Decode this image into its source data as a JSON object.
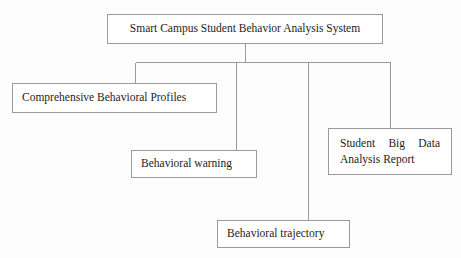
{
  "diagram": {
    "type": "hierarchy-tree",
    "orientation": "top-down",
    "line_color": "#9a9a9a",
    "box_border_color": "#9a9a9a",
    "background_color": "#fdfdfd",
    "text_color": "#1d1d1d",
    "root": {
      "id": "root",
      "label": "Smart Campus Student Behavior Analysis System"
    },
    "children": [
      {
        "id": "profiles",
        "label": "Comprehensive Behavioral Profiles"
      },
      {
        "id": "warning",
        "label": "Behavioral warning"
      },
      {
        "id": "trajectory",
        "label": "Behavioral trajectory"
      },
      {
        "id": "report",
        "label": "Student Big Data Analysis Report"
      }
    ]
  }
}
